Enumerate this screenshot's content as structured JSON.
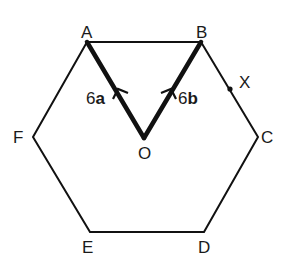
{
  "diagram": {
    "type": "regular-hexagon-vectors",
    "colors": {
      "line": "#111111",
      "text": "#1a1a1a",
      "background": "#ffffff"
    },
    "vertices": [
      {
        "id": "A",
        "label": "A",
        "x": 87,
        "y": 42
      },
      {
        "id": "B",
        "label": "B",
        "x": 201,
        "y": 42
      },
      {
        "id": "C",
        "label": "C",
        "x": 258,
        "y": 137
      },
      {
        "id": "D",
        "label": "D",
        "x": 204,
        "y": 232
      },
      {
        "id": "E",
        "label": "E",
        "x": 90,
        "y": 232
      },
      {
        "id": "F",
        "label": "F",
        "x": 33,
        "y": 137
      }
    ],
    "centre": {
      "id": "O",
      "label": "O",
      "x": 144,
      "y": 138
    },
    "point_x": {
      "label": "X",
      "on_segment": "BC",
      "x": 230,
      "y": 89
    },
    "vectors": [
      {
        "from": "O",
        "to": "A",
        "coefficient": "6",
        "symbol": "a",
        "label": "6a"
      },
      {
        "from": "O",
        "to": "B",
        "coefficient": "6",
        "symbol": "b",
        "label": "6b"
      }
    ],
    "labels": {
      "A": "A",
      "B": "B",
      "C": "C",
      "D": "D",
      "E": "E",
      "F": "F",
      "O": "O",
      "X": "X",
      "vec_a_coef": "6",
      "vec_a_sym": "a",
      "vec_b_coef": "6",
      "vec_b_sym": "b"
    }
  }
}
